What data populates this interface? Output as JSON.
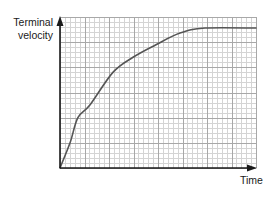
{
  "chart_data": {
    "type": "line",
    "title": "",
    "xlabel": "Time",
    "ylabel": "Terminal velocity",
    "ylabel_lines": [
      "Terminal",
      "velocity"
    ],
    "x_ticks": [],
    "y_ticks": [],
    "grid": true,
    "grid_style": "graph paper: major every 1 unit, minor every 0.2 unit",
    "xlim": [
      0,
      8
    ],
    "ylim": [
      0,
      6
    ],
    "legend": null,
    "series": [
      {
        "name": "velocity",
        "color": "#555555",
        "x": [
          0,
          0.41,
          0.73,
          1.22,
          2.16,
          2.98,
          3.88,
          4.9,
          5.92,
          8.0
        ],
        "y": [
          0,
          1.0,
          2.0,
          2.5,
          3.8,
          4.4,
          4.88,
          5.36,
          5.56,
          5.56
        ]
      }
    ],
    "annotations": [
      "curve rises steeply then levels off at terminal velocity"
    ]
  },
  "labels": {
    "y_line1": "Terminal",
    "y_line2": "velocity",
    "x": "Time"
  },
  "colors": {
    "axis": "#1a1a1a",
    "grid_major": "#a8a8a8",
    "grid_minor": "#d4d4d4",
    "curve": "#555555",
    "background": "#ffffff"
  },
  "plot_px": {
    "left": 60,
    "right": 256,
    "top": 17,
    "bottom": 168
  }
}
